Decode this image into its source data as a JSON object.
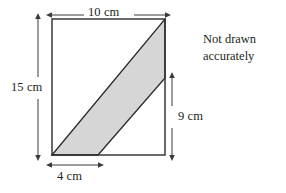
{
  "figure": {
    "note": {
      "line1": "Not drawn",
      "line2": "accurately"
    },
    "colors": {
      "shade_fill": "#d6d6d6",
      "stroke": "#3b3b3b",
      "shape_stroke": "#2b2b2b",
      "text": "#231f20",
      "background": "#ffffff"
    },
    "dimensions": [
      {
        "id": "top-width",
        "label": "10 cm",
        "value": 10,
        "unit": "cm",
        "orientation": "horizontal",
        "position": "above-rectangle"
      },
      {
        "id": "left-height",
        "label": "15 cm",
        "value": 15,
        "unit": "cm",
        "orientation": "vertical",
        "position": "left-of-rectangle"
      },
      {
        "id": "right-height",
        "label": "9 cm",
        "value": 9,
        "unit": "cm",
        "orientation": "vertical",
        "position": "right-of-rectangle"
      },
      {
        "id": "bottom-base",
        "label": "4 cm",
        "value": 4,
        "unit": "cm",
        "orientation": "horizontal",
        "position": "below-rectangle"
      }
    ],
    "shapes": {
      "rectangle": {
        "name": "outer-rectangle",
        "x": 52,
        "y": 19,
        "width": 113,
        "height": 136
      },
      "parallelogram": {
        "name": "shaded-parallelogram",
        "points": "52,155 165,19 165,78 98,155"
      }
    }
  }
}
